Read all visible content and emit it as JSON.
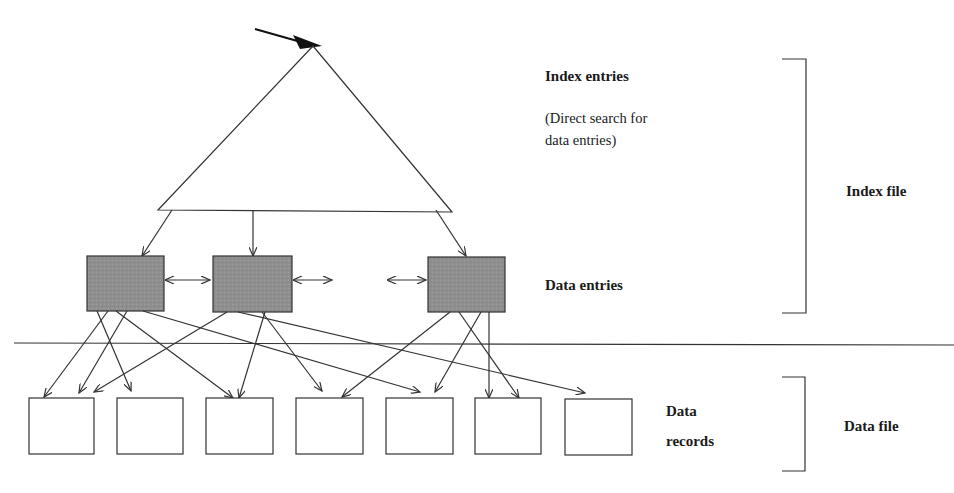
{
  "diagram": {
    "labels": {
      "index_entries": "Index entries",
      "direct_search_line1": "(Direct search for",
      "direct_search_line2": "data entries)",
      "data_entries": "Data entries",
      "index_file": "Index file",
      "data_records_line1": "Data",
      "data_records_line2": "records",
      "data_file": "Data file"
    },
    "colors": {
      "line": "#333333",
      "data_entry_fill": "#8f8f8f",
      "record_fill": "#ffffff"
    },
    "data_entry_count": 3,
    "data_record_count": 7
  }
}
